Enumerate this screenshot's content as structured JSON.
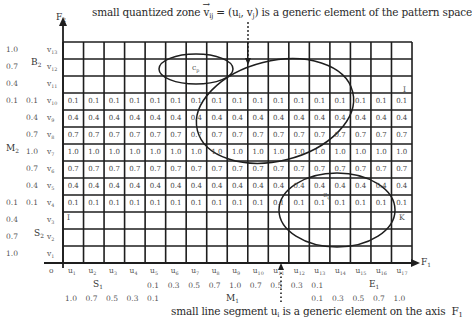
{
  "captions": {
    "top": "small quantized zone v⃗ij = (ui, vj) is a generic element of the pattern space",
    "top_parts": {
      "pre": "small quantized zone ",
      "vec": "v",
      "vec_sub": "ij",
      "mid": " = (u",
      "u_sub": "i",
      "comma": ", v",
      "v_sub": "j",
      "post": ") is a generic element of the pattern space"
    },
    "bottom_parts": {
      "pre": "small line segment u",
      "sub": "i",
      "post": " is a generic element on the axis ",
      "axis": "F",
      "axis_sub": "1"
    }
  },
  "axes": {
    "y_axis": {
      "name": "F",
      "sub": "2"
    },
    "x_axis": {
      "name": "F",
      "sub": "1"
    },
    "origin": "o"
  },
  "rows": [
    {
      "label": "v",
      "sub": "13",
      "membership_b2": "1.0"
    },
    {
      "label": "v",
      "sub": "12",
      "membership_b2": "0.7"
    },
    {
      "label": "v",
      "sub": "11",
      "membership_b2": "0.4"
    },
    {
      "label": "v",
      "sub": "10",
      "membership_b2": "0.1",
      "membership_m2": "0.1"
    },
    {
      "label": "v",
      "sub": "9",
      "membership_m2": "0.4"
    },
    {
      "label": "v",
      "sub": "8",
      "membership_m2": "0.7"
    },
    {
      "label": "v",
      "sub": "7",
      "membership_m2": "1.0"
    },
    {
      "label": "v",
      "sub": "6",
      "membership_m2": "0.7"
    },
    {
      "label": "v",
      "sub": "5",
      "membership_m2": "0.4"
    },
    {
      "label": "v",
      "sub": "4",
      "membership_m2": "0.1",
      "membership_s2": "0.1"
    },
    {
      "label": "v",
      "sub": "3",
      "membership_s2": "0.4"
    },
    {
      "label": "v",
      "sub": "2",
      "membership_s2": "0.7"
    },
    {
      "label": "v",
      "sub": "1",
      "membership_s2": "1.0"
    }
  ],
  "fuzzy_sets_y": {
    "B2": {
      "name": "B",
      "sub": "2"
    },
    "M2": {
      "name": "M",
      "sub": "2"
    },
    "S2": {
      "name": "S",
      "sub": "2"
    }
  },
  "columns": [
    {
      "label": "u",
      "sub": "1",
      "s1": "1.0"
    },
    {
      "label": "u",
      "sub": "2",
      "s1": "0.7"
    },
    {
      "label": "u",
      "sub": "3",
      "s1": "0.5"
    },
    {
      "label": "u",
      "sub": "4",
      "s1": "0.3"
    },
    {
      "label": "u",
      "sub": "5",
      "s1": "0.1",
      "m1": "0.1"
    },
    {
      "label": "u",
      "sub": "6",
      "m1": "0.3"
    },
    {
      "label": "u",
      "sub": "7",
      "m1": "0.5"
    },
    {
      "label": "u",
      "sub": "8",
      "m1": "0.7"
    },
    {
      "label": "u",
      "sub": "9",
      "m1": "1.0"
    },
    {
      "label": "u",
      "sub": "10",
      "m1": "0.7"
    },
    {
      "label": "u",
      "sub": "11",
      "m1": "0.5"
    },
    {
      "label": "u",
      "sub": "12",
      "m1": "0.3"
    },
    {
      "label": "u",
      "sub": "13",
      "m1": "0.1",
      "e1": "0.1"
    },
    {
      "label": "u",
      "sub": "14",
      "e1": "0.3"
    },
    {
      "label": "u",
      "sub": "15",
      "e1": "0.5"
    },
    {
      "label": "u",
      "sub": "16",
      "e1": "0.7"
    },
    {
      "label": "u",
      "sub": "17",
      "e1": "1.0"
    }
  ],
  "fuzzy_sets_x": {
    "S1": {
      "name": "S",
      "sub": "1"
    },
    "M1": {
      "name": "M",
      "sub": "1"
    },
    "E1": {
      "name": "E",
      "sub": "1"
    }
  },
  "cell_values_by_row": {
    "v10": "0.1",
    "v9": "0.4",
    "v8": "0.7",
    "v7": "1.0",
    "v6": "0.7",
    "v5": "0.4",
    "v4": "0.1"
  },
  "markers": {
    "top_right": "I",
    "bottom_left": "I",
    "bottom_right": "K",
    "c_ij_center": "c",
    "c_ij_sub": "ij",
    "c_p": "c",
    "c_p_sub": "p"
  },
  "colors": {
    "line": "#1e1e1e",
    "text": "#3a3a3a",
    "background": "#ffffff"
  }
}
